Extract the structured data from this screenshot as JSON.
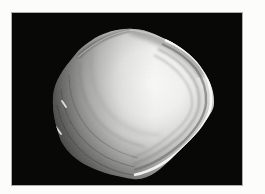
{
  "page": {
    "background_color": "#fcfcfb"
  },
  "photo": {
    "subject": "clam-shell",
    "alt_text": "Grayscale photograph of a clam shell lit from the upper right on a black background",
    "background_color": "#080807",
    "frame_border_color": "#6e6e6c",
    "shell_colors": {
      "highlight": "#fbfbfa",
      "light": "#e9e9e7",
      "mid": "#9d9d9b",
      "shadow": "#3c3c3a"
    }
  }
}
